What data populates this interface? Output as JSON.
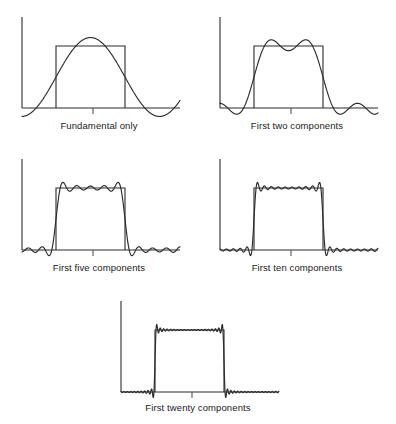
{
  "figure": {
    "background_color": "#ffffff",
    "line_color": "#2b2b2b",
    "caption_color": "#1a1a1a"
  },
  "chart_data": {
    "type": "line",
    "title": "",
    "xlabel": "",
    "ylabel": "",
    "grid": false,
    "legend": false,
    "xlim": [
      0,
      1
    ],
    "ylim": [
      -0.35,
      1.25
    ],
    "target_waveform": {
      "name": "square pulse",
      "low_value": 0,
      "high_value": 1,
      "rising_edge_x": 0.25,
      "falling_edge_x": 0.75
    },
    "panels": [
      {
        "id": "panel-1",
        "caption": "Fundamental only",
        "harmonics": 1,
        "terms": [
          1
        ],
        "overshoot": 0.27,
        "ripple_count": 0
      },
      {
        "id": "panel-2",
        "caption": "First two components",
        "harmonics": 2,
        "terms": [
          1,
          3
        ],
        "overshoot": 0.21,
        "ripple_count": 1
      },
      {
        "id": "panel-3",
        "caption": "First five components",
        "harmonics": 5,
        "terms": [
          1,
          3,
          5,
          7,
          9
        ],
        "overshoot": 0.12,
        "ripple_count": 4
      },
      {
        "id": "panel-4",
        "caption": "First ten components",
        "harmonics": 10,
        "terms": [
          1,
          3,
          5,
          7,
          9,
          11,
          13,
          15,
          17,
          19
        ],
        "overshoot": 0.11,
        "ripple_count": 9
      },
      {
        "id": "panel-5",
        "caption": "First twenty components",
        "harmonics": 20,
        "terms": [
          1,
          3,
          5,
          7,
          9,
          11,
          13,
          15,
          17,
          19,
          21,
          23,
          25,
          27,
          29,
          31,
          33,
          35,
          37,
          39
        ],
        "overshoot": 0.09,
        "ripple_count": 19
      }
    ]
  },
  "captions": {
    "panel1": "Fundamental only",
    "panel2": "First two components",
    "panel3": "First five components",
    "panel4": "First ten components",
    "panel5": "First twenty components"
  }
}
